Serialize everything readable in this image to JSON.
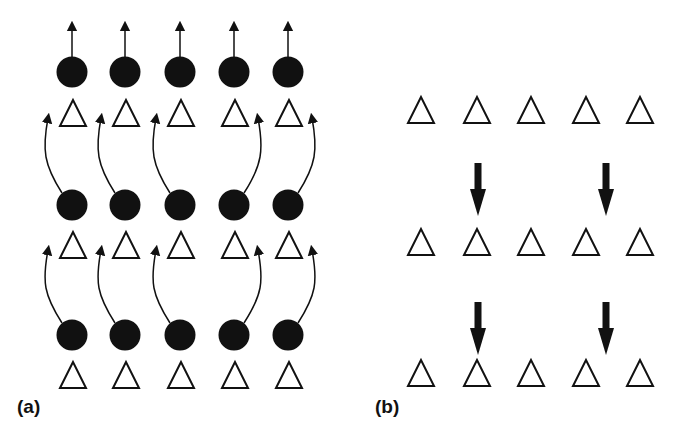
{
  "figure": {
    "panels": [
      {
        "id": "a",
        "label": "(a)",
        "description": "Three rows of filled circles above triangles; top row circles have straight up arrows, lower rows have curved arrows pointing to the triangle row above",
        "circle_columns_x": [
          72,
          125,
          180,
          234,
          288
        ],
        "circle_rows_y": [
          72,
          205,
          335
        ],
        "triangle_rows_top_y": [
          100,
          232,
          362
        ],
        "curved_arrow_direction_by_column": [
          "left",
          "left",
          "left",
          "right",
          "right"
        ]
      },
      {
        "id": "b",
        "label": "(b)",
        "description": "Three rows of five open triangles with four thick downward arrows above the 2nd and between 4th/5th triangles of the lower two rows",
        "triangle_columns_x": [
          421,
          477,
          531,
          586,
          640
        ],
        "triangle_rows_top_y": [
          97,
          229,
          360
        ],
        "down_arrows": [
          {
            "x": 478,
            "y1": 163,
            "y2": 216
          },
          {
            "x": 606,
            "y1": 163,
            "y2": 216
          },
          {
            "x": 478,
            "y1": 302,
            "y2": 355
          },
          {
            "x": 606,
            "y1": 302,
            "y2": 355
          }
        ]
      }
    ],
    "colors": {
      "ink": "#111111",
      "background": "#ffffff"
    }
  }
}
